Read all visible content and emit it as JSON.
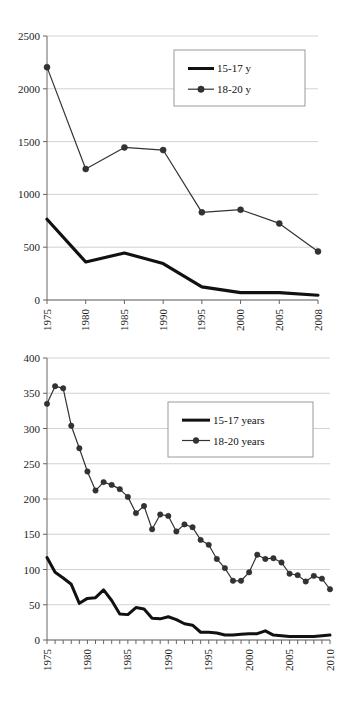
{
  "chart_data": [
    {
      "id": "top",
      "type": "line",
      "title": "",
      "subtitle": "",
      "xlabel": "",
      "ylabel": "",
      "grid": true,
      "legend_position": "top-right",
      "xlim": [
        1975,
        2008
      ],
      "ylim": [
        0,
        2500
      ],
      "ytick_labels": [
        "0",
        "500",
        "1000",
        "1500",
        "2000",
        "2500"
      ],
      "yticks": [
        0,
        500,
        1000,
        1500,
        2000,
        2500
      ],
      "categories": [
        "1975",
        "1980",
        "1985",
        "1990",
        "1995",
        "2000",
        "2005",
        "2008"
      ],
      "xtick_labels": [
        "1975",
        "1980",
        "1985",
        "1990",
        "1995",
        "2000",
        "2005",
        "2008"
      ],
      "series": [
        {
          "name": "15-17 y",
          "marker": "none",
          "color": "#111111",
          "width": 3.2,
          "values": [
            765,
            360,
            445,
            345,
            125,
            70,
            70,
            45
          ]
        },
        {
          "name": "18-20 y",
          "marker": "circle",
          "color": "#333333",
          "width": 1.2,
          "values": [
            2205,
            1240,
            1445,
            1420,
            830,
            855,
            725,
            460
          ]
        }
      ]
    },
    {
      "id": "bottom",
      "type": "line",
      "title": "",
      "subtitle": "",
      "xlabel": "",
      "ylabel": "",
      "grid": true,
      "legend_position": "top-right",
      "xlim": [
        1975,
        2010
      ],
      "ylim": [
        0,
        400
      ],
      "ytick_labels": [
        "0",
        "50",
        "100",
        "150",
        "200",
        "250",
        "300",
        "350",
        "400"
      ],
      "yticks": [
        0,
        50,
        100,
        150,
        200,
        250,
        300,
        350,
        400
      ],
      "x": [
        1975,
        1976,
        1977,
        1978,
        1979,
        1980,
        1981,
        1982,
        1983,
        1984,
        1985,
        1986,
        1987,
        1988,
        1989,
        1990,
        1991,
        1992,
        1993,
        1994,
        1995,
        1996,
        1997,
        1998,
        1999,
        2000,
        2001,
        2002,
        2003,
        2004,
        2005,
        2006,
        2007,
        2008,
        2009,
        2010
      ],
      "xtick_labels": [
        "1975",
        "1980",
        "1985",
        "1990",
        "1995",
        "2000",
        "2005",
        "2010"
      ],
      "xtick_values": [
        1975,
        1980,
        1985,
        1990,
        1995,
        2000,
        2005,
        2010
      ],
      "series": [
        {
          "name": "15-17 years",
          "marker": "none",
          "color": "#111111",
          "width": 3.0,
          "values": [
            117,
            96,
            88,
            79,
            52,
            59,
            60,
            71,
            56,
            37,
            36,
            46,
            44,
            31,
            30,
            33,
            29,
            23,
            21,
            11,
            11,
            10,
            7,
            7,
            8,
            9,
            9,
            13,
            7,
            6,
            5,
            5,
            5,
            5,
            6,
            7
          ]
        },
        {
          "name": "18-20 years",
          "marker": "circle",
          "color": "#333333",
          "width": 1.2,
          "values": [
            335,
            360,
            357,
            304,
            272,
            239,
            212,
            224,
            220,
            214,
            203,
            180,
            190,
            157,
            178,
            176,
            154,
            164,
            160,
            142,
            135,
            115,
            102,
            84,
            84,
            96,
            121,
            115,
            116,
            110,
            94,
            92,
            83,
            91,
            87,
            72
          ]
        }
      ]
    }
  ]
}
